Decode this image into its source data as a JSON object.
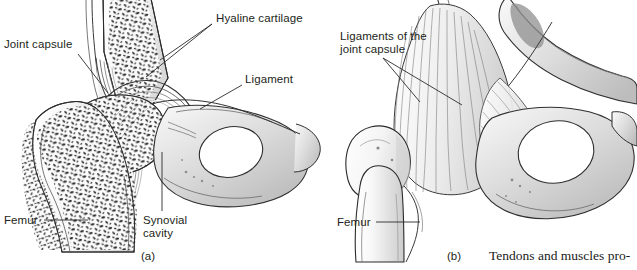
{
  "figure": {
    "type": "anatomical-illustration",
    "background_color": "#ffffff",
    "ink_color": "#231f20"
  },
  "panels": [
    {
      "id": "a",
      "letter": "(a)",
      "letter_pos": {
        "x": 141,
        "y": 250
      },
      "description": "Frontal section of hip joint showing femur head in acetabulum",
      "labels": [
        {
          "name": "joint-capsule",
          "text": "Joint capsule",
          "pos": {
            "x": 4,
            "y": 38
          },
          "leaders": [
            [
              {
                "x": 78,
                "y": 54
              },
              {
                "x": 108,
                "y": 93
              }
            ]
          ]
        },
        {
          "name": "hyaline-cartilage",
          "text": "Hyaline cartilage",
          "pos": {
            "x": 216,
            "y": 12
          },
          "leaders": [
            [
              {
                "x": 212,
                "y": 24
              },
              {
                "x": 160,
                "y": 60
              }
            ],
            [
              {
                "x": 212,
                "y": 24
              },
              {
                "x": 146,
                "y": 77
              }
            ]
          ]
        },
        {
          "name": "ligament",
          "text": "Ligament",
          "pos": {
            "x": 245,
            "y": 73
          },
          "leaders": [
            [
              {
                "x": 242,
                "y": 85
              },
              {
                "x": 200,
                "y": 109
              }
            ]
          ]
        },
        {
          "name": "synovial-cavity",
          "text": "Synovial\ncavity",
          "pos": {
            "x": 143,
            "y": 214
          },
          "leaders": [
            [
              {
                "x": 162,
                "y": 211
              },
              {
                "x": 162,
                "y": 152
              }
            ]
          ]
        },
        {
          "name": "femur",
          "text": "Femur",
          "pos": {
            "x": 4,
            "y": 214
          },
          "leaders": [
            [
              {
                "x": 44,
                "y": 220
              },
              {
                "x": 88,
                "y": 220
              }
            ]
          ]
        }
      ]
    },
    {
      "id": "b",
      "letter": "(b)",
      "letter_pos": {
        "x": 447,
        "y": 250
      },
      "description": "Anterior view of hip joint showing ligaments of the joint capsule",
      "labels": [
        {
          "name": "ligaments-of-the-joint-capsule",
          "text": "Ligaments of the\njoint capsule",
          "pos": {
            "x": 340,
            "y": 30
          },
          "leaders": [
            [
              {
                "x": 383,
                "y": 58
              },
              {
                "x": 462,
                "y": 105
              }
            ],
            [
              {
                "x": 383,
                "y": 58
              },
              {
                "x": 420,
                "y": 102
              }
            ]
          ]
        },
        {
          "name": "femur",
          "text": "Femur",
          "pos": {
            "x": 337,
            "y": 216
          },
          "leaders": [
            [
              {
                "x": 376,
                "y": 222
              },
              {
                "x": 420,
                "y": 222
              }
            ]
          ]
        }
      ]
    }
  ],
  "caption": {
    "name": "body-text-caption",
    "text": "Tendons and muscles pro-",
    "pos": {
      "x": 489,
      "y": 248
    }
  }
}
